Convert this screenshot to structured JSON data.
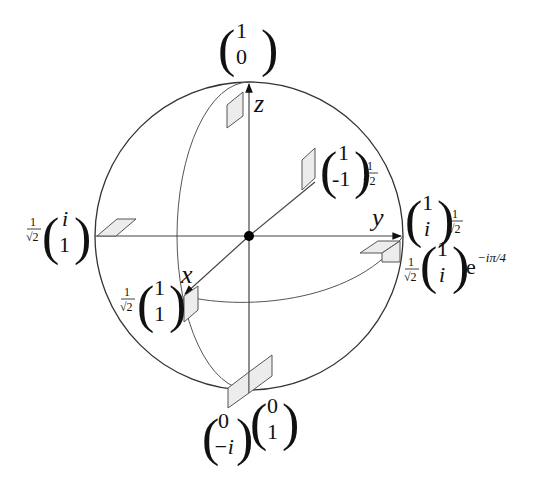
{
  "diagram": {
    "colors": {
      "sphere_stroke": "#333333",
      "axis_stroke": "#444444",
      "parallelogram_fill": "#e6e6e6",
      "parallelogram_stroke": "#555555",
      "center_dot": "#000000"
    },
    "axes": {
      "x": "x",
      "y": "y",
      "z": "z"
    },
    "states": {
      "top": {
        "prefix": "",
        "top": "1",
        "bottom": "0",
        "suffix": ""
      },
      "upper_right": {
        "prefix": "",
        "top": "1",
        "bottom": "-1",
        "suffix": "1/√2"
      },
      "right": {
        "prefix": "",
        "top": "1",
        "bottom": "i",
        "suffix": "1/√2"
      },
      "right_lower": {
        "prefix": "1/√2",
        "top": "1",
        "bottom": "i",
        "suffix": "e^{-iπ/4}"
      },
      "left": {
        "prefix": "1/√2",
        "top": "i",
        "bottom": "1",
        "suffix": ""
      },
      "x_axis": {
        "prefix": "1/√2",
        "top": "1",
        "bottom": "1",
        "suffix": ""
      },
      "bottom_left": {
        "prefix": "",
        "top": "0",
        "bottom": "−i",
        "suffix": ""
      },
      "bottom_right": {
        "prefix": "",
        "top": "0",
        "bottom": "1",
        "suffix": ""
      }
    },
    "labels": {
      "frac_num": "1",
      "frac_den": "√2",
      "exp_base": "e",
      "exp_power": "−iπ/4"
    }
  }
}
